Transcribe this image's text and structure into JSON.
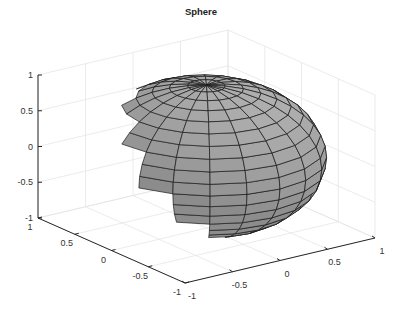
{
  "chart_data": {
    "type": "surface",
    "title": "Sphere",
    "xlabel": "",
    "ylabel": "",
    "zlabel": "",
    "xlim": [
      -1,
      1
    ],
    "ylim": [
      -1,
      1
    ],
    "zlim": [
      -1,
      1
    ],
    "x_ticks": [
      "-1",
      "-0.5",
      "0",
      "0.5",
      "1"
    ],
    "y_ticks": [
      "1",
      "0.5",
      "0",
      "-0.5",
      "-1"
    ],
    "z_ticks": [
      "-1",
      "-0.5",
      "0",
      "0.5",
      "1"
    ],
    "grid": true,
    "surface": {
      "shape": "unit sphere (rendered as flattened ellipsoid due to axis aspect)",
      "radius": 1,
      "face_color": "#9e9e9e",
      "edge_color": "#1a1a1a",
      "meridians": 20,
      "parallels": 20
    }
  },
  "figure": {
    "title": "Sphere",
    "background": "#ffffff",
    "grid_color": "#e6e6e6",
    "axis_color": "#262626"
  }
}
